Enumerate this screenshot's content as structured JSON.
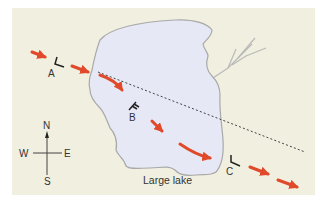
{
  "diagram": {
    "title": "",
    "colors": {
      "background": "#ffffff",
      "land": "#f1efdf",
      "lake_fill": "#e6e8f5",
      "lake_outline": "#a9a9a9",
      "arrow": "#e04a2a",
      "dotted_line": "#444444",
      "wind_barb": "#222222",
      "label": "#333333"
    },
    "lake": {
      "label": "Large lake"
    },
    "points": [
      {
        "id": "A",
        "label": "A"
      },
      {
        "id": "B",
        "label": "B"
      },
      {
        "id": "C",
        "label": "C"
      }
    ],
    "compass": {
      "north": "N",
      "south": "S",
      "east": "E",
      "west": "W"
    },
    "storm_track": {
      "segments": 7,
      "direction": "northwest-to-southeast"
    },
    "dotted_line": {
      "description": "straight-line path from upwind shore toward C"
    }
  }
}
